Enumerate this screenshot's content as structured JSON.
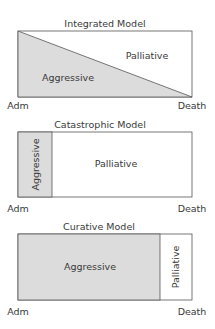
{
  "colors": {
    "shade": "#dcdcdc",
    "stroke": "#555555",
    "text": "#3a3a3a"
  },
  "panels": [
    {
      "title": "Integrated Model",
      "start_label": "Adm",
      "end_label": "Death",
      "aggressive_label": "Aggressive",
      "palliative_label": "Palliative"
    },
    {
      "title": "Catastrophic Model",
      "start_label": "Adm",
      "end_label": "Death",
      "aggressive_label": "Aggressive",
      "palliative_label": "Palliative"
    },
    {
      "title": "Curative Model",
      "start_label": "Adm",
      "end_label": "Death",
      "aggressive_label": "Aggressive",
      "palliative_label": "Palliative"
    }
  ]
}
